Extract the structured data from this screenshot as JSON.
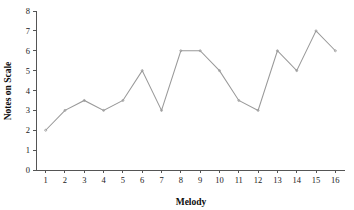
{
  "chart_data": {
    "type": "line",
    "title": "",
    "xlabel": "Melody",
    "ylabel": "Notes on Scale",
    "x": [
      1,
      2,
      3,
      4,
      5,
      6,
      7,
      8,
      9,
      10,
      11,
      12,
      13,
      14,
      15,
      16
    ],
    "values": [
      2,
      3,
      3.5,
      3,
      3.5,
      5,
      3,
      6,
      6,
      5,
      3.5,
      3,
      6,
      5,
      7,
      6
    ],
    "series": [
      {
        "name": "Notes on Scale",
        "values": [
          2,
          3,
          3.5,
          3,
          3.5,
          5,
          3,
          6,
          6,
          5,
          3.5,
          3,
          6,
          5,
          7,
          6
        ]
      }
    ],
    "xlim": [
      0.5,
      16.5
    ],
    "ylim": [
      0,
      8
    ],
    "xticks": [
      1,
      2,
      3,
      4,
      5,
      6,
      7,
      8,
      9,
      10,
      11,
      12,
      13,
      14,
      15,
      16
    ],
    "xtick_labels": [
      "1",
      "2",
      "3",
      "4",
      "5",
      "6",
      "7",
      "8",
      "9",
      "10",
      "11",
      "12",
      "13",
      "14",
      "15",
      "16"
    ],
    "yticks": [
      0,
      1,
      2,
      3,
      4,
      5,
      6,
      7,
      8
    ],
    "ytick_labels": [
      "0",
      "1",
      "2",
      "3",
      "4",
      "5",
      "6",
      "7",
      "8"
    ],
    "grid": false,
    "legend": false,
    "legend_position": "none",
    "line_color": "#999999",
    "marker": "dot",
    "background_color": "#ffffff",
    "axis_color": "#555555"
  }
}
